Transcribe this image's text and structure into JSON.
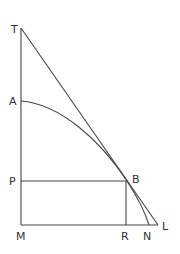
{
  "diagram": {
    "type": "geometric-figure",
    "labels": {
      "T": "T",
      "A": "A",
      "P": "P",
      "M": "M",
      "B": "B",
      "R": "R",
      "N": "N",
      "L": "L"
    },
    "points": {
      "T": [
        21,
        28
      ],
      "A": [
        21,
        101
      ],
      "P": [
        21,
        181
      ],
      "M": [
        21,
        225
      ],
      "B": [
        127,
        181
      ],
      "R": [
        126,
        225
      ],
      "N": [
        149,
        225
      ],
      "L": [
        158,
        225
      ]
    },
    "segments": [
      [
        "T",
        "M"
      ],
      [
        "M",
        "L"
      ],
      [
        "T",
        "L"
      ],
      [
        "P",
        "B"
      ],
      [
        "B",
        "R"
      ]
    ],
    "curves": [
      {
        "name": "arc-A-B-N",
        "through": [
          "A",
          "B",
          "N"
        ]
      }
    ],
    "colors": {
      "line": "#444444",
      "text": "#333333",
      "background": "#ffffff"
    }
  }
}
